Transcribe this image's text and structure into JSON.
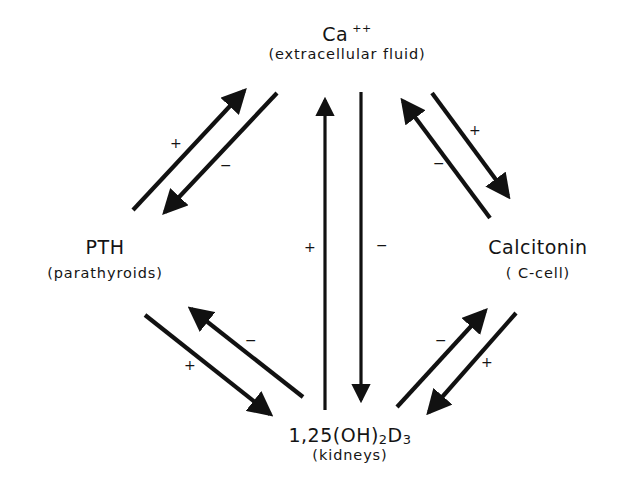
{
  "diagram": {
    "nodes": {
      "calcium": {
        "name": "Ca",
        "superscript": "++",
        "subtitle": "(extracellular fluid)"
      },
      "pth": {
        "name": "PTH",
        "subtitle": "(parathyroids)"
      },
      "calcitonin": {
        "name": "Calcitonin",
        "subtitle": "( C-cell)"
      },
      "vitd": {
        "name_prefix": "1,25(OH)",
        "name_sub1": "2",
        "name_mid": "D",
        "name_sub2": "3",
        "subtitle": "(kidneys)"
      }
    },
    "edges": [
      {
        "from": "pth",
        "to": "calcium",
        "sign": "+"
      },
      {
        "from": "calcium",
        "to": "pth",
        "sign": "−"
      },
      {
        "from": "vitd",
        "to": "calcium",
        "sign": "+"
      },
      {
        "from": "calcium",
        "to": "vitd",
        "sign": "−"
      },
      {
        "from": "calcium",
        "to": "calcitonin",
        "sign": "+"
      },
      {
        "from": "calcitonin",
        "to": "calcium",
        "sign": "−"
      },
      {
        "from": "pth",
        "to": "vitd",
        "sign": "+"
      },
      {
        "from": "vitd",
        "to": "pth",
        "sign": "−"
      },
      {
        "from": "calcitonin",
        "to": "vitd",
        "sign": "+"
      },
      {
        "from": "vitd",
        "to": "calcitonin",
        "sign": "−"
      }
    ]
  }
}
